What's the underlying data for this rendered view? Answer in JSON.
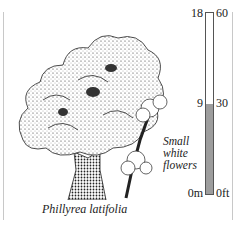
{
  "figure": {
    "species_label": "Phillyrea latifolia",
    "flower_label_lines": [
      "Small",
      "white",
      "flowers"
    ],
    "illustration": "tree-drawing"
  },
  "height_scale": {
    "meters_ticks": [
      {
        "label": "18",
        "value": 18
      },
      {
        "label": "9",
        "value": 9
      },
      {
        "label": "0m",
        "value": 0
      }
    ],
    "feet_ticks": [
      {
        "label": "60",
        "value": 60
      },
      {
        "label": "30",
        "value": 30
      },
      {
        "label": "0ft",
        "value": 0
      }
    ],
    "max_m": 18,
    "fill_to_m": 9,
    "fill_color": "#9d9d9d",
    "border_color": "#555555"
  }
}
